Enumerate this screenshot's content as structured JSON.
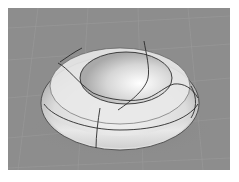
{
  "viewport": {
    "type": "3D perspective render",
    "object": "torus-like surface with isocurve seams",
    "background_color": "#8d8d8d",
    "grid_color": "#9a9a9a",
    "surface_color": "#e6e6e6",
    "seam_color": "#2a2a2a"
  }
}
